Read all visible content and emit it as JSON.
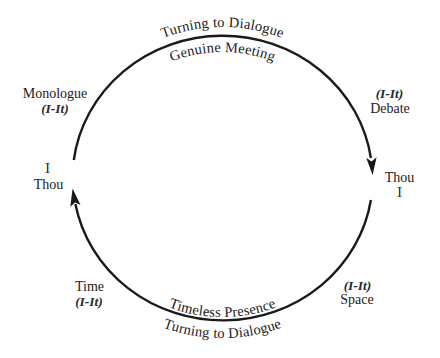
{
  "diagram": {
    "top_outer_label": "Turning to Dialogue",
    "top_inner_label": "Genuine Meeting",
    "bottom_inner_label": "Timeless Presence",
    "bottom_outer_label": "Turning to Dialogue",
    "left_pole": {
      "line1": "I",
      "line2": "Thou"
    },
    "right_pole": {
      "line1": "Thou",
      "line2": "I"
    },
    "upper_left": {
      "label": "Monologue",
      "relation": "(I-It)"
    },
    "upper_right": {
      "relation": "(I-It)",
      "label": "Debate"
    },
    "lower_left": {
      "label": "Time",
      "relation": "(I-It)"
    },
    "lower_right": {
      "relation": "(I-It)",
      "label": "Space"
    },
    "arrows": [
      {
        "arc": "top",
        "direction": "clockwise",
        "head_at": "right"
      },
      {
        "arc": "bottom",
        "direction": "clockwise",
        "head_at": "left"
      }
    ]
  },
  "colors": {
    "stroke": "#1a1a1a",
    "text": "#222222",
    "background": "#ffffff"
  }
}
